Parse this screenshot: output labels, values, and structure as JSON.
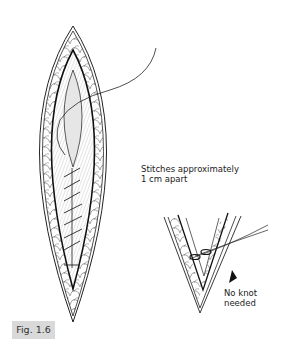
{
  "figure": {
    "label": "Fig. 1.6",
    "annotations": {
      "stitches_line1": "Stitches approximately",
      "stitches_line2": "1 cm apart",
      "knot_line1": "No knot",
      "knot_line2": "needed"
    }
  },
  "colors": {
    "ink": "#222222",
    "label_bg": "#d9d9d9",
    "wound_fill": "#e6e6e6"
  }
}
